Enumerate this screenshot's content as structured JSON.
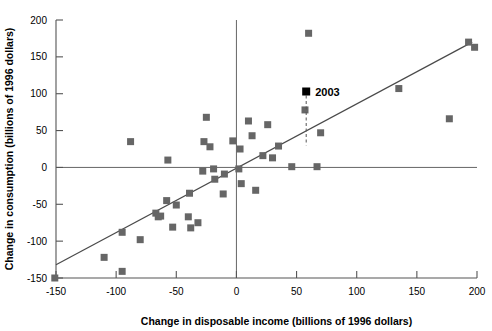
{
  "chart_data": {
    "type": "scatter",
    "title": "",
    "xlabel": "Change in disposable income (billions of 1996 dollars)",
    "ylabel": "Change in consumption (billions of 1996 dollars)",
    "xlim": [
      -160,
      205
    ],
    "ylim": [
      -155,
      200
    ],
    "xticks": [
      -150,
      -100,
      -50,
      0,
      50,
      100,
      150,
      200
    ],
    "xtick_labels": [
      "-150",
      "-100",
      "-50",
      "0",
      "50",
      "100",
      "150",
      "200"
    ],
    "yticks": [
      -150,
      -100,
      -50,
      0,
      50,
      100,
      150,
      200
    ],
    "ytick_labels": [
      "-150",
      "-100",
      "-50",
      "0",
      "50",
      "100",
      "150",
      "200"
    ],
    "grid": false,
    "legend": null,
    "marker_color": "#666666",
    "highlight_color": "#000000",
    "line_color": "#4a4a4a",
    "points": [
      {
        "x": -151,
        "y": -150
      },
      {
        "x": -110,
        "y": -122
      },
      {
        "x": -95,
        "y": -141
      },
      {
        "x": -95,
        "y": -88
      },
      {
        "x": -88,
        "y": 35
      },
      {
        "x": -80,
        "y": -98
      },
      {
        "x": -67,
        "y": -62
      },
      {
        "x": -65,
        "y": -67
      },
      {
        "x": -63,
        "y": -66
      },
      {
        "x": -58,
        "y": -45
      },
      {
        "x": -57,
        "y": 10
      },
      {
        "x": -53,
        "y": -81
      },
      {
        "x": -50,
        "y": -51
      },
      {
        "x": -40,
        "y": -67
      },
      {
        "x": -39,
        "y": -35
      },
      {
        "x": -38,
        "y": -82
      },
      {
        "x": -32,
        "y": -75
      },
      {
        "x": -28,
        "y": -5
      },
      {
        "x": -27,
        "y": 35
      },
      {
        "x": -25,
        "y": 68
      },
      {
        "x": -22,
        "y": 28
      },
      {
        "x": -19,
        "y": -2
      },
      {
        "x": -18,
        "y": -16
      },
      {
        "x": -11,
        "y": -36
      },
      {
        "x": -10,
        "y": -9
      },
      {
        "x": -3,
        "y": 36
      },
      {
        "x": 2,
        "y": -2
      },
      {
        "x": 3,
        "y": 25
      },
      {
        "x": 4,
        "y": -22
      },
      {
        "x": 10,
        "y": 63
      },
      {
        "x": 13,
        "y": 43
      },
      {
        "x": 16,
        "y": -31
      },
      {
        "x": 22,
        "y": 16
      },
      {
        "x": 26,
        "y": 58
      },
      {
        "x": 30,
        "y": 13
      },
      {
        "x": 35,
        "y": 29
      },
      {
        "x": 46,
        "y": 1
      },
      {
        "x": 57,
        "y": 78
      },
      {
        "x": 60,
        "y": 182
      },
      {
        "x": 67,
        "y": 1
      },
      {
        "x": 70,
        "y": 47
      },
      {
        "x": 135,
        "y": 107
      },
      {
        "x": 177,
        "y": 66
      },
      {
        "x": 193,
        "y": 170
      },
      {
        "x": 198,
        "y": 163
      }
    ],
    "highlight_point": {
      "x": 58,
      "y": 103,
      "label": "2003"
    },
    "leader_line": {
      "x": 58,
      "y_top": 103,
      "y_bottom": 30
    },
    "fit_line": {
      "x_start": -150,
      "y_start": -132,
      "x_end": 196,
      "y_end": 170
    }
  }
}
